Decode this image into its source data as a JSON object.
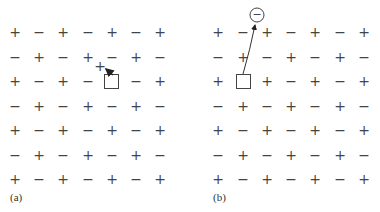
{
  "panels": [
    {
      "label": "(a)",
      "description": "Cation jumps into vacancy (Frenkel-type / vacancy migration)",
      "grid": [
        [
          "+",
          "−",
          "+",
          "−",
          "+",
          "−",
          "+"
        ],
        [
          "−",
          "+",
          "−",
          "+",
          "−",
          "+",
          "−"
        ],
        [
          "+",
          "−",
          "+",
          "−",
          "",
          "−",
          "+"
        ],
        [
          "−",
          "+",
          "−",
          "+",
          "−",
          "+",
          "−"
        ],
        [
          "+",
          "−",
          "+",
          "−",
          "+",
          "−",
          "+"
        ],
        [
          "−",
          "+",
          "−",
          "+",
          "−",
          "+",
          "−"
        ],
        [
          "+",
          "−",
          "+",
          "−",
          "+",
          "−",
          "+"
        ]
      ],
      "vacancy": {
        "row": 2,
        "col": 4
      },
      "displaced_ion": "+"
    },
    {
      "label": "(b)",
      "description": "Anion moved out of lattice to surface, leaving vacancy",
      "grid": [
        [
          "+",
          "−",
          "+",
          "−",
          "+",
          "−",
          "+"
        ],
        [
          "−",
          "+",
          "−",
          "+",
          "−",
          "+",
          "−"
        ],
        [
          "+",
          "",
          "+",
          "−",
          "+",
          "−",
          "+"
        ],
        [
          "−",
          "+",
          "−",
          "+",
          "−",
          "+",
          "−"
        ],
        [
          "+",
          "−",
          "+",
          "−",
          "+",
          "−",
          "+"
        ],
        [
          "−",
          "+",
          "−",
          "+",
          "−",
          "+",
          "−"
        ],
        [
          "+",
          "−",
          "+",
          "−",
          "+",
          "−",
          "+"
        ]
      ],
      "vacancy": {
        "row": 2,
        "col": 1
      },
      "displaced_ion": "−"
    }
  ]
}
